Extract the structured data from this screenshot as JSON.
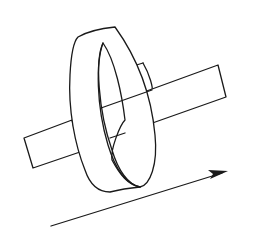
{
  "diagram": {
    "elements": [
      {
        "id": "bar",
        "shape": "rectangular-prism",
        "label": ""
      },
      {
        "id": "ring",
        "shape": "band-loop",
        "label": ""
      },
      {
        "id": "arrow",
        "shape": "arrow",
        "direction": "up-right",
        "label": ""
      }
    ],
    "colors": {
      "line": "#1a1a1a",
      "background": "#ffffff"
    }
  }
}
